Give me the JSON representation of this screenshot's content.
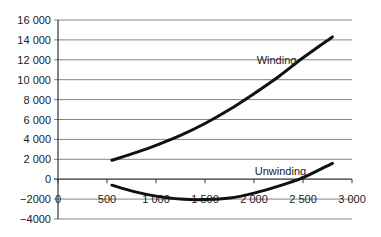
{
  "chart_data": {
    "type": "line",
    "title": "",
    "xlabel": "",
    "ylabel": "",
    "xlim": [
      0,
      3000
    ],
    "ylim": [
      -4000,
      16000
    ],
    "x_ticks": [
      0,
      500,
      1000,
      1500,
      2000,
      2500,
      3000
    ],
    "x_tick_labels": [
      "0",
      "500",
      "1 000",
      "1 500",
      "2 000",
      "2 500",
      "3 000"
    ],
    "y_ticks": [
      -4000,
      -2000,
      0,
      2000,
      4000,
      6000,
      8000,
      10000,
      12000,
      14000,
      16000
    ],
    "y_tick_labels": [
      "−4000",
      "−2000",
      "0",
      "2 000",
      "4 000",
      "6 000",
      "8 000",
      "10 000",
      "12 000",
      "14 000",
      "16 000"
    ],
    "grid": "horizontal",
    "legend": "none (inline labels)",
    "series": [
      {
        "name": "Winding",
        "x": [
          550,
          800,
          1000,
          1250,
          1500,
          1750,
          2000,
          2250,
          2500,
          2800
        ],
        "values": [
          1900,
          2700,
          3400,
          4400,
          5600,
          7000,
          8600,
          10300,
          12200,
          14300
        ],
        "label_pos": {
          "x": 2230,
          "y": 12000
        }
      },
      {
        "name": "Unwinding",
        "x": [
          550,
          800,
          1000,
          1250,
          1500,
          1750,
          2000,
          2250,
          2500,
          2800
        ],
        "values": [
          -600,
          -1300,
          -1700,
          -2000,
          -2050,
          -1900,
          -1400,
          -700,
          150,
          1600
        ],
        "label_pos": {
          "x": 2270,
          "y": 800
        }
      }
    ]
  }
}
